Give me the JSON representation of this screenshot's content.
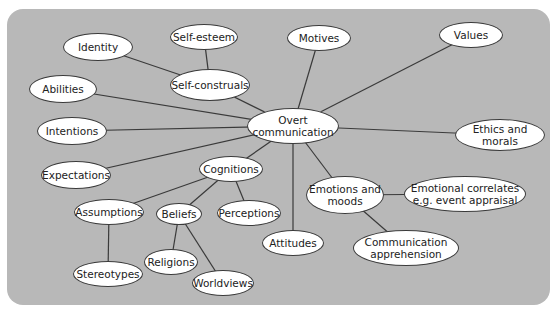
{
  "diagram": {
    "type": "mind-map",
    "background_color": "#b8b8b8",
    "node_fill": "#ffffff",
    "edge_color": "#3a3a3a",
    "nodes": [
      {
        "id": "overt",
        "label": "Overt\ncommunication",
        "cx": 293,
        "cy": 126,
        "w": 92,
        "h": 36
      },
      {
        "id": "identity",
        "label": "Identity",
        "cx": 98,
        "cy": 47,
        "w": 70,
        "h": 28
      },
      {
        "id": "selfesteem",
        "label": "Self-esteem",
        "cx": 204,
        "cy": 37,
        "w": 68,
        "h": 26
      },
      {
        "id": "motives",
        "label": "Motives",
        "cx": 319,
        "cy": 38,
        "w": 64,
        "h": 26
      },
      {
        "id": "values",
        "label": "Values",
        "cx": 471,
        "cy": 35,
        "w": 64,
        "h": 26
      },
      {
        "id": "abilities",
        "label": "Abilities",
        "cx": 63,
        "cy": 89,
        "w": 68,
        "h": 28
      },
      {
        "id": "selfconstruals",
        "label": "Self-construals",
        "cx": 210,
        "cy": 85,
        "w": 80,
        "h": 32
      },
      {
        "id": "intentions",
        "label": "Intentions",
        "cx": 72,
        "cy": 131,
        "w": 70,
        "h": 28
      },
      {
        "id": "ethics",
        "label": "Ethics and morals",
        "cx": 500,
        "cy": 135,
        "w": 90,
        "h": 32
      },
      {
        "id": "expectations",
        "label": "Expectations",
        "cx": 76,
        "cy": 175,
        "w": 70,
        "h": 28
      },
      {
        "id": "cognitions",
        "label": "Cognitions",
        "cx": 231,
        "cy": 169,
        "w": 64,
        "h": 26
      },
      {
        "id": "emotions",
        "label": "Emotions and\nmoods",
        "cx": 345,
        "cy": 195,
        "w": 78,
        "h": 38
      },
      {
        "id": "emocorrelates",
        "label": "Emotional correlates\ne.g. event appraisal",
        "cx": 465,
        "cy": 194,
        "w": 122,
        "h": 36
      },
      {
        "id": "assumptions",
        "label": "Assumptions",
        "cx": 109,
        "cy": 212,
        "w": 70,
        "h": 26
      },
      {
        "id": "beliefs",
        "label": "Beliefs",
        "cx": 179,
        "cy": 214,
        "w": 46,
        "h": 22
      },
      {
        "id": "perceptions",
        "label": "Perceptions",
        "cx": 249,
        "cy": 213,
        "w": 64,
        "h": 26
      },
      {
        "id": "attitudes",
        "label": "Attitudes",
        "cx": 293,
        "cy": 243,
        "w": 62,
        "h": 26
      },
      {
        "id": "commapprehension",
        "label": "Communication\napprehension",
        "cx": 406,
        "cy": 248,
        "w": 106,
        "h": 36
      },
      {
        "id": "stereotypes",
        "label": "Stereotypes",
        "cx": 108,
        "cy": 274,
        "w": 70,
        "h": 26
      },
      {
        "id": "religions",
        "label": "Religions",
        "cx": 171,
        "cy": 262,
        "w": 54,
        "h": 26
      },
      {
        "id": "worldviews",
        "label": "Worldviews",
        "cx": 223,
        "cy": 283,
        "w": 62,
        "h": 26
      }
    ],
    "edges": [
      [
        "overt",
        "abilities"
      ],
      [
        "overt",
        "intentions"
      ],
      [
        "overt",
        "expectations"
      ],
      [
        "overt",
        "selfconstruals"
      ],
      [
        "overt",
        "motives"
      ],
      [
        "overt",
        "values"
      ],
      [
        "overt",
        "ethics"
      ],
      [
        "overt",
        "cognitions"
      ],
      [
        "overt",
        "attitudes"
      ],
      [
        "overt",
        "emotions"
      ],
      [
        "selfconstruals",
        "identity"
      ],
      [
        "selfconstruals",
        "selfesteem"
      ],
      [
        "cognitions",
        "assumptions"
      ],
      [
        "cognitions",
        "beliefs"
      ],
      [
        "cognitions",
        "perceptions"
      ],
      [
        "assumptions",
        "stereotypes"
      ],
      [
        "beliefs",
        "religions"
      ],
      [
        "beliefs",
        "worldviews"
      ],
      [
        "emotions",
        "emocorrelates"
      ],
      [
        "emotions",
        "commapprehension"
      ]
    ]
  }
}
